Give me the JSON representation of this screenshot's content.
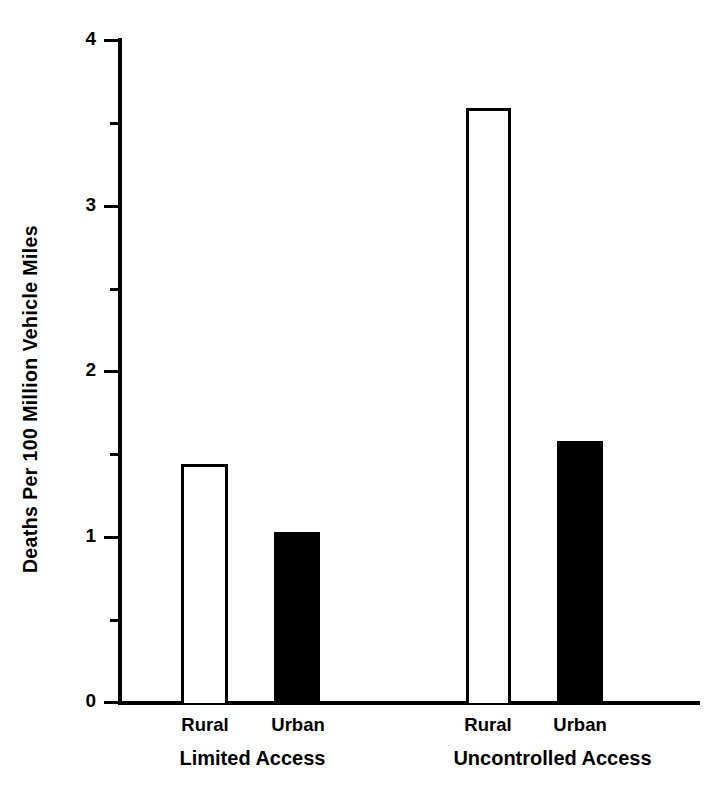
{
  "chart_data": {
    "type": "bar",
    "title": "",
    "subtitle": "",
    "xlabel": "",
    "ylabel": "Deaths Per 100 Million Vehicle Miles",
    "ylim": [
      0,
      4
    ],
    "ytick_labels": [
      "0",
      "1",
      "2",
      "3",
      "4"
    ],
    "ytick_values": [
      0,
      1,
      2,
      3,
      4
    ],
    "yminor_ticks": [
      0.5,
      1.5,
      2.5,
      3.5
    ],
    "grid": false,
    "legend": "none",
    "categories": [
      "Rural",
      "Urban",
      "Rural",
      "Urban"
    ],
    "groups": [
      {
        "name": "Limited Access",
        "bars": [
          {
            "label": "Rural",
            "value": 1.44,
            "style": "open"
          },
          {
            "label": "Urban",
            "value": 1.03,
            "style": "filled"
          }
        ]
      },
      {
        "name": "Uncontrolled Access",
        "bars": [
          {
            "label": "Rural",
            "value": 3.59,
            "style": "open"
          },
          {
            "label": "Urban",
            "value": 1.58,
            "style": "filled"
          }
        ]
      }
    ],
    "values": [
      1.44,
      1.03,
      3.59,
      1.58
    ],
    "colors": {
      "open_fill": "#ffffff",
      "filled_fill": "#000000",
      "axis": "#000000",
      "text": "#000000"
    }
  },
  "axis": {
    "y_title": "Deaths Per 100 Million Vehicle Miles",
    "tick_0": "0",
    "tick_1": "1",
    "tick_2": "2",
    "tick_3": "3",
    "tick_4": "4"
  },
  "labels": {
    "group1_bar1": "Rural",
    "group1_bar2": "Urban",
    "group1_name": "Limited Access",
    "group2_bar1": "Rural",
    "group2_bar2": "Urban",
    "group2_name": "Uncontrolled Access"
  }
}
